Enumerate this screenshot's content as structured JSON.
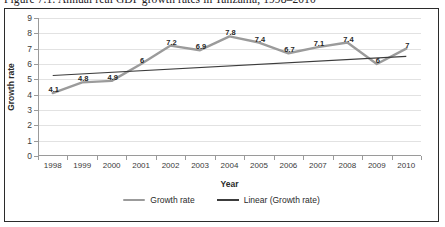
{
  "figure": {
    "caption": "Figure 7.1: Annual real GDP growth rates in Tanzania, 1998–2010"
  },
  "colors": {
    "series_line": "#9b9b9b",
    "trend_line": "#3c3c3c",
    "gridline": "#e2e2e2",
    "axis": "#9a9a9a",
    "text": "#2a2a2a",
    "frame": "#2b2b2b",
    "background": "#ffffff"
  },
  "legend": {
    "position": "bottom",
    "items": [
      {
        "label": "Growth rate",
        "style": "thick-gray"
      },
      {
        "label": "Linear (Growth rate)",
        "style": "thin-dark"
      }
    ]
  },
  "chart_data": {
    "type": "line",
    "title": "",
    "xlabel": "Year",
    "ylabel": "Growth rate",
    "categories": [
      "1998",
      "1999",
      "2000",
      "2001",
      "2002",
      "2003",
      "2004",
      "2005",
      "2006",
      "2007",
      "2008",
      "2009",
      "2010"
    ],
    "ylim": [
      0,
      9
    ],
    "yticks": [
      0,
      1,
      2,
      3,
      4,
      5,
      6,
      7,
      8,
      9
    ],
    "grid": "horizontal",
    "series": [
      {
        "name": "Growth rate",
        "values": [
          4.1,
          4.8,
          4.9,
          6,
          7.2,
          6.9,
          7.8,
          7.4,
          6.7,
          7.1,
          7.4,
          6,
          7
        ],
        "labels": [
          "4.1",
          "4.8",
          "4.9",
          "6",
          "7.2",
          "6.9",
          "7.8",
          "7.4",
          "6.7",
          "7.1",
          "7.4",
          "6",
          "7"
        ],
        "style": "thick-gray",
        "show_data_labels": true
      },
      {
        "name": "Linear (Growth rate)",
        "trend": true,
        "endpoints": [
          5.25,
          6.5
        ],
        "style": "thin-dark",
        "show_data_labels": false
      }
    ]
  }
}
